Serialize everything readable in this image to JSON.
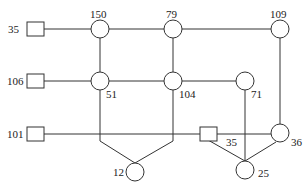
{
  "diagram": {
    "type": "network-graph",
    "nodes": [
      {
        "id": "s35a",
        "shape": "square",
        "label": "35",
        "x": 35,
        "y": 29
      },
      {
        "id": "s106",
        "shape": "square",
        "label": "106",
        "x": 35,
        "y": 81
      },
      {
        "id": "s101",
        "shape": "square",
        "label": "101",
        "x": 35,
        "y": 134
      },
      {
        "id": "c150",
        "shape": "circle",
        "label": "150",
        "x": 100,
        "y": 29
      },
      {
        "id": "c79",
        "shape": "circle",
        "label": "79",
        "x": 173,
        "y": 29
      },
      {
        "id": "c109",
        "shape": "circle",
        "label": "109",
        "x": 280,
        "y": 29
      },
      {
        "id": "c51",
        "shape": "circle",
        "label": "51",
        "x": 100,
        "y": 81
      },
      {
        "id": "c104",
        "shape": "circle",
        "label": "104",
        "x": 173,
        "y": 81
      },
      {
        "id": "c71",
        "shape": "circle",
        "label": "71",
        "x": 245,
        "y": 81
      },
      {
        "id": "s35b",
        "shape": "square",
        "label": "35",
        "x": 208,
        "y": 134
      },
      {
        "id": "c36",
        "shape": "circle",
        "label": "36",
        "x": 280,
        "y": 134
      },
      {
        "id": "c12",
        "shape": "circle",
        "label": "12",
        "x": 135,
        "y": 172
      },
      {
        "id": "c25",
        "shape": "circle",
        "label": "25",
        "x": 245,
        "y": 170
      }
    ],
    "labels": {
      "s35a": "35",
      "s106": "106",
      "s101": "101",
      "c150": "150",
      "c79": "79",
      "c109": "109",
      "c51": "51",
      "c104": "104",
      "c71": "71",
      "s35b": "35",
      "c36": "36",
      "c12": "12",
      "c25": "25"
    },
    "edges": [
      [
        "s35a",
        "c150"
      ],
      [
        "c150",
        "c79"
      ],
      [
        "c79",
        "c109"
      ],
      [
        "s106",
        "c51"
      ],
      [
        "c51",
        "c104"
      ],
      [
        "c104",
        "c71"
      ],
      [
        "s101",
        "s35b"
      ],
      [
        "s35b",
        "c36"
      ],
      [
        "c150",
        "c51"
      ],
      [
        "c79",
        "c104"
      ],
      [
        "c51",
        "c12"
      ],
      [
        "c104",
        "c12"
      ],
      [
        "c71",
        "c25"
      ],
      [
        "s35b",
        "c25"
      ],
      [
        "c36",
        "c25"
      ],
      [
        "c109",
        "c36"
      ]
    ]
  }
}
